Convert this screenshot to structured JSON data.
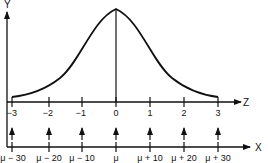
{
  "diagram": {
    "type": "normal-distribution-standardization",
    "colors": {
      "ink": "#111111",
      "background": "#ffffff"
    },
    "y_axis": {
      "label": "Y"
    },
    "z_axis": {
      "label": "Z",
      "ticks": [
        "−3",
        "−2",
        "−1",
        "0",
        "1",
        "2",
        "3"
      ]
    },
    "x_axis": {
      "label": "X",
      "ticks": [
        "μ − 30",
        "μ − 20",
        "μ − 10",
        "μ",
        "μ + 10",
        "μ + 20",
        "μ + 30"
      ]
    },
    "mapping_arrows": 7
  }
}
